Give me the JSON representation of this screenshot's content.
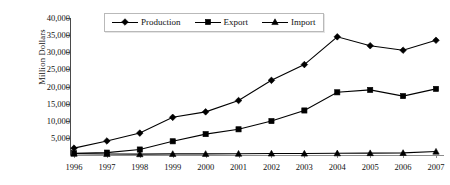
{
  "chart_data": {
    "type": "line",
    "title": "",
    "xlabel": "",
    "ylabel": "Million Dollars",
    "categories": [
      "1996",
      "1997",
      "1998",
      "1999",
      "2000",
      "2001",
      "2002",
      "2003",
      "2004",
      "2005",
      "2006",
      "2007"
    ],
    "ylim": [
      0,
      40000
    ],
    "ytick_step": 5000,
    "ytick_labels": [
      "40,000",
      "35,000",
      "30,000",
      "25,000",
      "20,000",
      "15,000",
      "10,000",
      "5,000"
    ],
    "ytick_values": [
      40000,
      35000,
      30000,
      25000,
      20000,
      15000,
      10000,
      5000
    ],
    "grid": false,
    "legend_position": "top-center",
    "series": [
      {
        "name": "Production",
        "marker": "diamond",
        "color": "#000000",
        "values": [
          2000,
          4100,
          6400,
          11000,
          12600,
          15900,
          21800,
          26400,
          34500,
          31900,
          30600,
          33500
        ]
      },
      {
        "name": "Export",
        "marker": "square",
        "color": "#000000",
        "values": [
          500,
          700,
          1600,
          4000,
          6100,
          7500,
          9900,
          13000,
          18300,
          19000,
          17200,
          19300
        ]
      },
      {
        "name": "Import",
        "marker": "triangle",
        "color": "#000000",
        "values": [
          400,
          300,
          250,
          320,
          330,
          380,
          430,
          420,
          500,
          560,
          620,
          1000
        ]
      }
    ]
  },
  "legend": {
    "items": [
      {
        "label": "Production",
        "marker": "diamond"
      },
      {
        "label": "Export",
        "marker": "square"
      },
      {
        "label": "Import",
        "marker": "triangle"
      }
    ]
  },
  "axis": {
    "y_title": "Million Dollars"
  }
}
